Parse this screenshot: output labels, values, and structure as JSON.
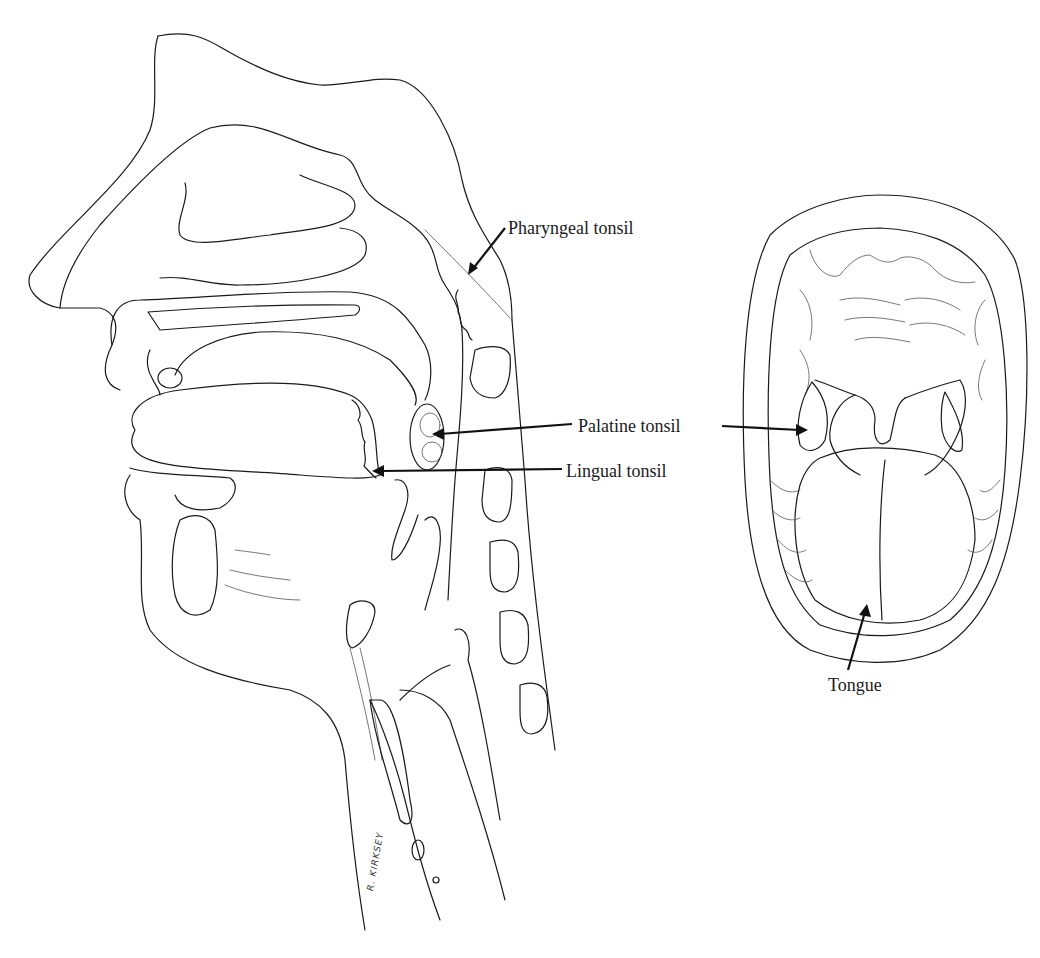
{
  "figure": {
    "sagittal_view": {
      "labels": [
        {
          "id": "pharyngeal",
          "text": "Pharyngeal tonsil",
          "x": 508,
          "y": 219
        },
        {
          "id": "palatine",
          "text": "Palatine tonsil",
          "x": 578,
          "y": 417
        },
        {
          "id": "lingual",
          "text": "Lingual tonsil",
          "x": 566,
          "y": 462
        }
      ],
      "signature": "R. KIRKSEY"
    },
    "oral_view": {
      "labels": [
        {
          "id": "tongue",
          "text": "Tongue",
          "x": 828,
          "y": 676
        }
      ]
    },
    "colors": {
      "line": "#1a1a1a",
      "background": "#ffffff"
    }
  }
}
